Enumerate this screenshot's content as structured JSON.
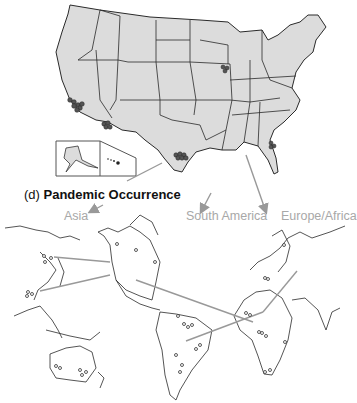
{
  "figure": {
    "panel_label": "(d)",
    "title": "Pandemic Occurrence",
    "regions": [
      {
        "label": "Asia"
      },
      {
        "label": "South America"
      },
      {
        "label": "Europe/Africa"
      }
    ],
    "us_map": {
      "outbreak_clusters": [
        "California",
        "Arizona",
        "Texas",
        "Illinois",
        "Florida"
      ],
      "inset": [
        "Alaska",
        "Hawaii"
      ]
    },
    "world_map": {
      "spread_lines": [
        "North America to Asia (Japan)",
        "North America to Asia (China)",
        "North America to Africa",
        "Europe to South America"
      ]
    },
    "colors": {
      "land_fill": "#dcdcdc",
      "border": "#2a2a2a",
      "arrow": "#999999",
      "region_label": "#a8a8a8"
    }
  }
}
